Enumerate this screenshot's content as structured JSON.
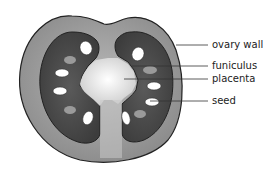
{
  "diagram": {
    "labels": [
      {
        "id": "ovary-wall",
        "text": "ovary wall"
      },
      {
        "id": "funiculus",
        "text": "funiculus"
      },
      {
        "id": "placenta",
        "text": "placenta"
      },
      {
        "id": "seed",
        "text": "seed"
      }
    ],
    "colors": {
      "ovary_wall": "#9a9a9a",
      "locule": "#4a4a4a",
      "placenta": "#f2f2f2",
      "seed": "#ffffff",
      "outline": "#222222",
      "leader": "#333333"
    }
  }
}
